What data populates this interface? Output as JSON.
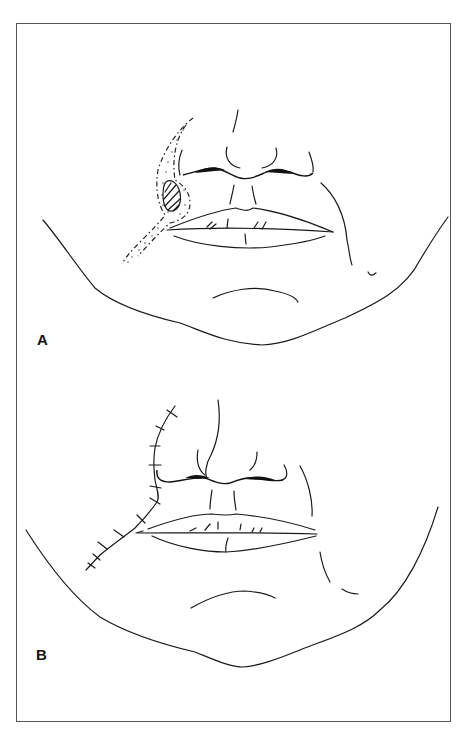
{
  "figure": {
    "panels": [
      {
        "label": "A",
        "description": "Lower face with lesion at left nasolabial region, hatched lesion surrounded by dashed excision margin with stippled flap area along nasolabial fold"
      },
      {
        "label": "B",
        "description": "Lower face after closure, sutured incision line along nasolabial fold extending to lip commissure"
      }
    ],
    "colors": {
      "line": "#1a1a1a",
      "frame": "#555555",
      "background": "#ffffff"
    }
  }
}
